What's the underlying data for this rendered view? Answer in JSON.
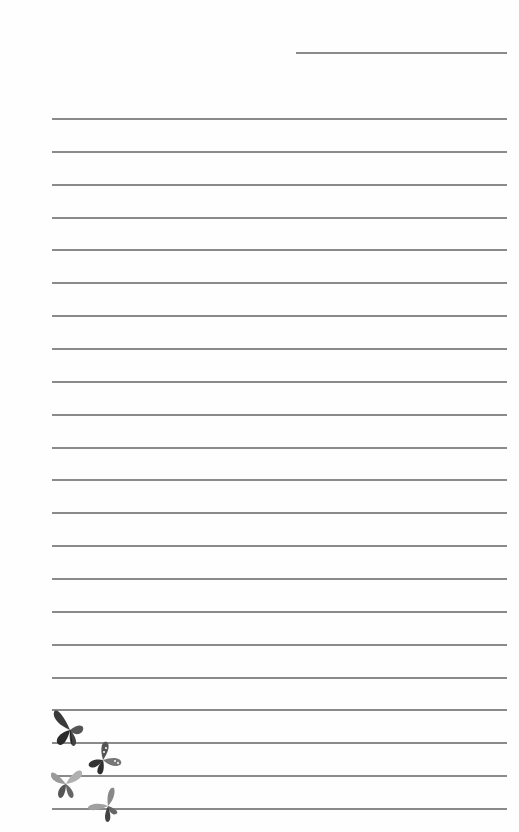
{
  "stationery": {
    "header_line": {
      "x": 296,
      "y": 52,
      "width": 211
    },
    "ruled_lines": {
      "count": 22,
      "start_y": 118,
      "spacing": 32.86,
      "x": 52,
      "width": 455,
      "color": "#8a8a8a"
    },
    "decoration": {
      "type": "butterflies",
      "count": 4,
      "colors": [
        "#2e2e2e",
        "#5a5a5a",
        "#9a9a9a",
        "#c8c8c8"
      ]
    }
  }
}
